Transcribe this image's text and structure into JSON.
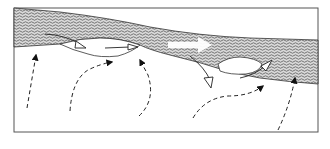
{
  "diagram": {
    "type": "schematic-flow-diagram",
    "colors": {
      "background": "#ffffff",
      "frame": "#555555",
      "hatch": "#8a8a8a",
      "band_fill": "#bdbdbd",
      "line": "#222222"
    },
    "elements": {
      "band": "hatched-layer",
      "lenses": [
        "lens-left",
        "lens-right"
      ],
      "dashed_arrows": 5,
      "white_arrows": 4
    }
  }
}
